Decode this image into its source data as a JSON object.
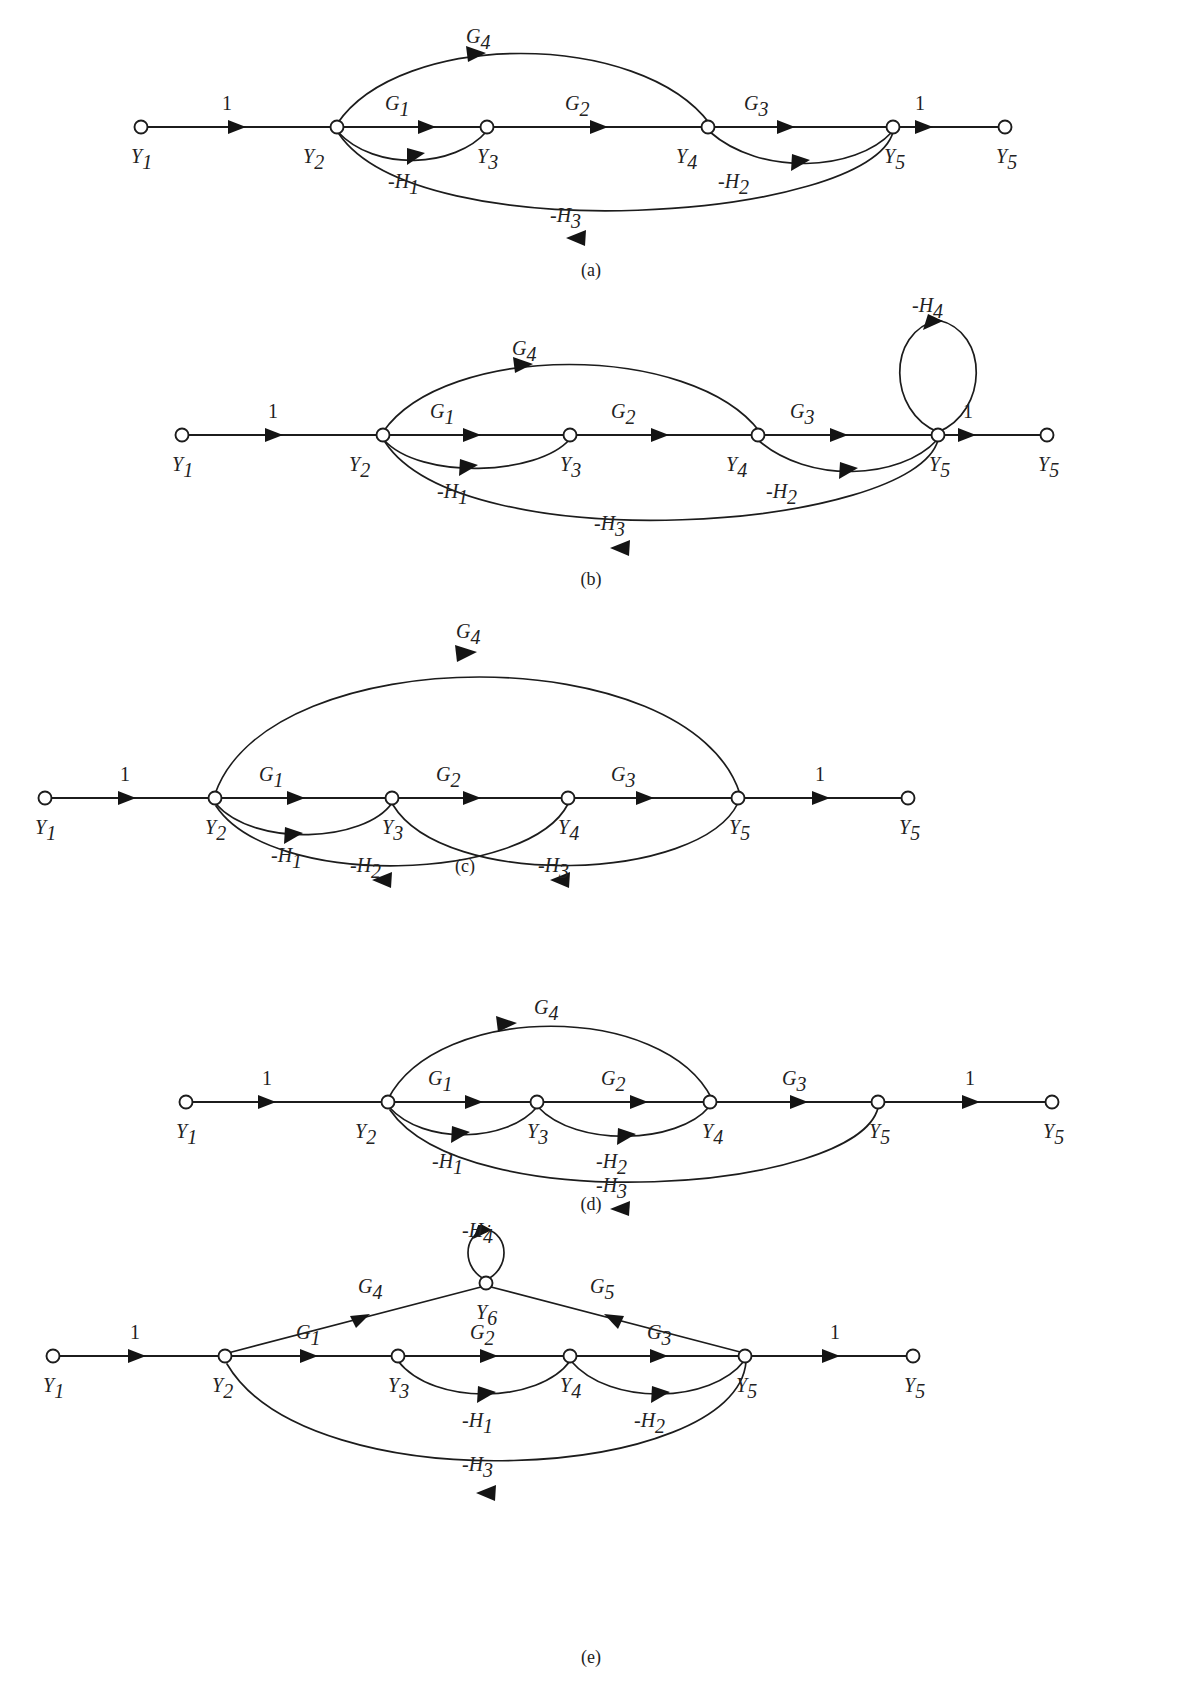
{
  "figure": {
    "kind": "signal-flow-graph-series",
    "panel_count": 5,
    "stroke_color": "#1c1c1c",
    "background_color": "#ffffff",
    "node_labels_common": [
      "Y1",
      "Y2",
      "Y3",
      "Y4",
      "Y5",
      "Y6"
    ],
    "gain_labels_common": [
      "1",
      "G1",
      "G2",
      "G3",
      "G4",
      "G5",
      "-H1",
      "-H2",
      "-H3",
      "-H4"
    ]
  },
  "panels": [
    {
      "id": "a",
      "caption": "(a)",
      "nodes": [
        {
          "id": "n1",
          "base": "Y",
          "sub": "1"
        },
        {
          "id": "n2",
          "base": "Y",
          "sub": "2"
        },
        {
          "id": "n3",
          "base": "Y",
          "sub": "3"
        },
        {
          "id": "n4",
          "base": "Y",
          "sub": "4"
        },
        {
          "id": "n5",
          "base": "Y",
          "sub": "5"
        },
        {
          "id": "n6",
          "base": "Y",
          "sub": "5"
        }
      ],
      "edges": [
        {
          "id": "e1",
          "from": "Y1",
          "to": "Y2",
          "base": "1",
          "sub": "",
          "shape": "straight"
        },
        {
          "id": "e2",
          "from": "Y2",
          "to": "Y3",
          "base": "G",
          "sub": "1",
          "shape": "straight"
        },
        {
          "id": "e3",
          "from": "Y3",
          "to": "Y4",
          "base": "G",
          "sub": "2",
          "shape": "straight"
        },
        {
          "id": "e4",
          "from": "Y4",
          "to": "Y5",
          "base": "G",
          "sub": "3",
          "shape": "straight"
        },
        {
          "id": "e5",
          "from": "Y5",
          "to": "Y5out",
          "base": "1",
          "sub": "",
          "shape": "straight"
        },
        {
          "id": "e6",
          "from": "Y2",
          "to": "Y4",
          "base": "G",
          "sub": "4",
          "shape": "arc-above"
        },
        {
          "id": "e7",
          "from": "Y3",
          "to": "Y2",
          "base": "-H",
          "sub": "1",
          "shape": "arc-below"
        },
        {
          "id": "e8",
          "from": "Y5",
          "to": "Y4",
          "base": "-H",
          "sub": "2",
          "shape": "arc-below"
        },
        {
          "id": "e9",
          "from": "Y5",
          "to": "Y2",
          "base": "-H",
          "sub": "3",
          "shape": "arc-below-deep"
        }
      ]
    },
    {
      "id": "b",
      "caption": "(b)",
      "nodes": [
        {
          "id": "n1",
          "base": "Y",
          "sub": "1"
        },
        {
          "id": "n2",
          "base": "Y",
          "sub": "2"
        },
        {
          "id": "n3",
          "base": "Y",
          "sub": "3"
        },
        {
          "id": "n4",
          "base": "Y",
          "sub": "4"
        },
        {
          "id": "n5",
          "base": "Y",
          "sub": "5"
        },
        {
          "id": "n6",
          "base": "Y",
          "sub": "5"
        }
      ],
      "edges": [
        {
          "id": "e1",
          "from": "Y1",
          "to": "Y2",
          "base": "1",
          "sub": "",
          "shape": "straight"
        },
        {
          "id": "e2",
          "from": "Y2",
          "to": "Y3",
          "base": "G",
          "sub": "1",
          "shape": "straight"
        },
        {
          "id": "e3",
          "from": "Y3",
          "to": "Y4",
          "base": "G",
          "sub": "2",
          "shape": "straight"
        },
        {
          "id": "e4",
          "from": "Y4",
          "to": "Y5",
          "base": "G",
          "sub": "3",
          "shape": "straight"
        },
        {
          "id": "e5",
          "from": "Y5",
          "to": "Y5out",
          "base": "1",
          "sub": "",
          "shape": "straight"
        },
        {
          "id": "e6",
          "from": "Y2",
          "to": "Y4",
          "base": "G",
          "sub": "4",
          "shape": "arc-above"
        },
        {
          "id": "e7",
          "from": "Y3",
          "to": "Y2",
          "base": "-H",
          "sub": "1",
          "shape": "arc-below"
        },
        {
          "id": "e8",
          "from": "Y5",
          "to": "Y4",
          "base": "-H",
          "sub": "2",
          "shape": "arc-below"
        },
        {
          "id": "e9",
          "from": "Y5",
          "to": "Y2",
          "base": "-H",
          "sub": "3",
          "shape": "arc-below-deep"
        },
        {
          "id": "e10",
          "from": "Y5",
          "to": "Y5",
          "base": "-H",
          "sub": "4",
          "shape": "self-loop-above"
        }
      ]
    },
    {
      "id": "c",
      "caption": "(c)",
      "nodes": [
        {
          "id": "n1",
          "base": "Y",
          "sub": "1"
        },
        {
          "id": "n2",
          "base": "Y",
          "sub": "2"
        },
        {
          "id": "n3",
          "base": "Y",
          "sub": "3"
        },
        {
          "id": "n4",
          "base": "Y",
          "sub": "4"
        },
        {
          "id": "n5",
          "base": "Y",
          "sub": "5"
        },
        {
          "id": "n6",
          "base": "Y",
          "sub": "5"
        }
      ],
      "edges": [
        {
          "id": "e1",
          "from": "Y1",
          "to": "Y2",
          "base": "1",
          "sub": "",
          "shape": "straight"
        },
        {
          "id": "e2",
          "from": "Y2",
          "to": "Y3",
          "base": "G",
          "sub": "1",
          "shape": "straight"
        },
        {
          "id": "e3",
          "from": "Y3",
          "to": "Y4",
          "base": "G",
          "sub": "2",
          "shape": "straight"
        },
        {
          "id": "e4",
          "from": "Y4",
          "to": "Y5",
          "base": "G",
          "sub": "3",
          "shape": "straight"
        },
        {
          "id": "e5",
          "from": "Y5",
          "to": "Y5out",
          "base": "1",
          "sub": "",
          "shape": "straight"
        },
        {
          "id": "e6",
          "from": "Y2",
          "to": "Y5",
          "base": "G",
          "sub": "4",
          "shape": "arc-above-wide"
        },
        {
          "id": "e7",
          "from": "Y3",
          "to": "Y2",
          "base": "-H",
          "sub": "1",
          "shape": "arc-below"
        },
        {
          "id": "e8",
          "from": "Y4",
          "to": "Y2",
          "base": "-H",
          "sub": "2",
          "shape": "arc-below-cross"
        },
        {
          "id": "e9",
          "from": "Y5",
          "to": "Y3",
          "base": "-H",
          "sub": "3",
          "shape": "arc-below-cross"
        }
      ]
    },
    {
      "id": "d",
      "caption": "(d)",
      "nodes": [
        {
          "id": "n1",
          "base": "Y",
          "sub": "1"
        },
        {
          "id": "n2",
          "base": "Y",
          "sub": "2"
        },
        {
          "id": "n3",
          "base": "Y",
          "sub": "3"
        },
        {
          "id": "n4",
          "base": "Y",
          "sub": "4"
        },
        {
          "id": "n5",
          "base": "Y",
          "sub": "5"
        },
        {
          "id": "n6",
          "base": "Y",
          "sub": "5"
        }
      ],
      "edges": [
        {
          "id": "e1",
          "from": "Y1",
          "to": "Y2",
          "base": "1",
          "sub": "",
          "shape": "straight"
        },
        {
          "id": "e2",
          "from": "Y2",
          "to": "Y3",
          "base": "G",
          "sub": "1",
          "shape": "straight"
        },
        {
          "id": "e3",
          "from": "Y3",
          "to": "Y4",
          "base": "G",
          "sub": "2",
          "shape": "straight"
        },
        {
          "id": "e4",
          "from": "Y4",
          "to": "Y5",
          "base": "G",
          "sub": "3",
          "shape": "straight"
        },
        {
          "id": "e5",
          "from": "Y5",
          "to": "Y5out",
          "base": "1",
          "sub": "",
          "shape": "straight"
        },
        {
          "id": "e6",
          "from": "Y2",
          "to": "Y4",
          "base": "G",
          "sub": "4",
          "shape": "arc-above"
        },
        {
          "id": "e7",
          "from": "Y3",
          "to": "Y2",
          "base": "-H",
          "sub": "1",
          "shape": "arc-below"
        },
        {
          "id": "e8",
          "from": "Y4",
          "to": "Y3",
          "base": "-H",
          "sub": "2",
          "shape": "arc-below"
        },
        {
          "id": "e9",
          "from": "Y5",
          "to": "Y2",
          "base": "-H",
          "sub": "3",
          "shape": "arc-below-deep"
        }
      ]
    },
    {
      "id": "e",
      "caption": "(e)",
      "nodes": [
        {
          "id": "n1",
          "base": "Y",
          "sub": "1"
        },
        {
          "id": "n2",
          "base": "Y",
          "sub": "2"
        },
        {
          "id": "n3",
          "base": "Y",
          "sub": "3"
        },
        {
          "id": "n4",
          "base": "Y",
          "sub": "4"
        },
        {
          "id": "n5",
          "base": "Y",
          "sub": "5"
        },
        {
          "id": "n6",
          "base": "Y",
          "sub": "5"
        },
        {
          "id": "n7",
          "base": "Y",
          "sub": "6"
        }
      ],
      "edges": [
        {
          "id": "e1",
          "from": "Y1",
          "to": "Y2",
          "base": "1",
          "sub": "",
          "shape": "straight"
        },
        {
          "id": "e2",
          "from": "Y2",
          "to": "Y3",
          "base": "G",
          "sub": "1",
          "shape": "straight"
        },
        {
          "id": "e3",
          "from": "Y3",
          "to": "Y4",
          "base": "G",
          "sub": "2",
          "shape": "straight"
        },
        {
          "id": "e4",
          "from": "Y4",
          "to": "Y5",
          "base": "G",
          "sub": "3",
          "shape": "straight"
        },
        {
          "id": "e5",
          "from": "Y5",
          "to": "Y5out",
          "base": "1",
          "sub": "",
          "shape": "straight"
        },
        {
          "id": "e6",
          "from": "Y2",
          "to": "Y6",
          "base": "G",
          "sub": "4",
          "shape": "straight-up"
        },
        {
          "id": "e7",
          "from": "Y6",
          "to": "Y5",
          "base": "G",
          "sub": "5",
          "shape": "straight-down"
        },
        {
          "id": "e8",
          "from": "Y4",
          "to": "Y3",
          "base": "-H",
          "sub": "1",
          "shape": "arc-below"
        },
        {
          "id": "e9",
          "from": "Y5",
          "to": "Y4",
          "base": "-H",
          "sub": "2",
          "shape": "arc-below"
        },
        {
          "id": "e10",
          "from": "Y5",
          "to": "Y2",
          "base": "-H",
          "sub": "3",
          "shape": "arc-below-deep"
        },
        {
          "id": "e11",
          "from": "Y6",
          "to": "Y6",
          "base": "-H",
          "sub": "4",
          "shape": "self-loop-above-small"
        }
      ]
    }
  ]
}
